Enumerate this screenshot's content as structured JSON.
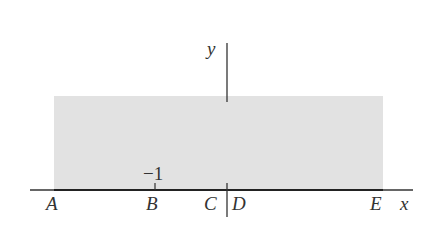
{
  "diagram": {
    "axes": {
      "x_label": "x",
      "y_label": "y"
    },
    "region": {
      "fill": "#e2e2e2",
      "description": "shaded rectangle above x-axis"
    },
    "tick": {
      "label": "−1",
      "at_point": "B"
    },
    "points": [
      {
        "label": "A"
      },
      {
        "label": "B"
      },
      {
        "label": "C"
      },
      {
        "label": "D"
      },
      {
        "label": "E"
      }
    ]
  }
}
